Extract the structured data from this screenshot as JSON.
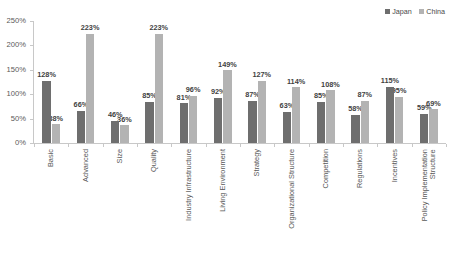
{
  "chart_data": {
    "type": "bar",
    "title": "",
    "subtitle": "",
    "xlabel": "",
    "ylabel": "",
    "ylim": [
      0,
      250
    ],
    "ytick_values": [
      0,
      50,
      100,
      150,
      200,
      250
    ],
    "ytick_labels": [
      "0%",
      "50%",
      "100%",
      "150%",
      "200%",
      "250%"
    ],
    "grid": false,
    "legend_position": "top-right",
    "value_label_suffix": "%",
    "categories": [
      "Basic",
      "Advanced",
      "Size",
      "Quality",
      "Industry Infrastructure",
      "Living Environment",
      "Strategy",
      "Organizational Structure",
      "Competition",
      "Regulations",
      "Incentives",
      "Policy Implementation Structure"
    ],
    "category_label_lines": [
      [
        "Basic"
      ],
      [
        "Advanced"
      ],
      [
        "Size"
      ],
      [
        "Quality"
      ],
      [
        "Industry Infrastructure"
      ],
      [
        "Living Environment"
      ],
      [
        "Strategy"
      ],
      [
        "Organizational Structure"
      ],
      [
        "Competition"
      ],
      [
        "Regulations"
      ],
      [
        "Incentives"
      ],
      [
        "Policy Implementation",
        "Structure"
      ]
    ],
    "series": [
      {
        "name": "Japan",
        "color": "#6e6e6e",
        "values": [
          128,
          66,
          46,
          85,
          81,
          92,
          87,
          63,
          85,
          58,
          115,
          59
        ],
        "value_labels": [
          "128%",
          "66%",
          "46%",
          "85%",
          "81%",
          "92%",
          "87%",
          "63%",
          "85%",
          "58%",
          "115%",
          "59%"
        ]
      },
      {
        "name": "China",
        "color": "#b3b3b3",
        "values": [
          38,
          223,
          36,
          223,
          96,
          149,
          127,
          114,
          108,
          87,
          95,
          69
        ],
        "value_labels": [
          "38%",
          "223%",
          "36%",
          "223%",
          "96%",
          "149%",
          "127%",
          "114%",
          "108%",
          "87%",
          "95%",
          "69%"
        ]
      }
    ]
  }
}
